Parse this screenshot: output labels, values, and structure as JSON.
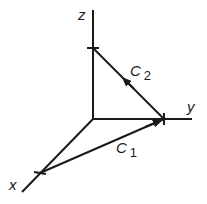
{
  "diagram": {
    "type": "3d-axes-path-diagram",
    "colors": {
      "line": "#1a1a1a",
      "background": "#ffffff"
    },
    "axes": [
      {
        "name": "z",
        "label": "z"
      },
      {
        "name": "y",
        "label": "y"
      },
      {
        "name": "x",
        "label": "x"
      }
    ],
    "paths": [
      {
        "name": "C1",
        "label_main": "C",
        "label_sub": "1",
        "from": "x-axis point",
        "to": "y-axis point"
      },
      {
        "name": "C2",
        "label_main": "C",
        "label_sub": "2",
        "from": "y-axis point",
        "to": "z-axis point"
      }
    ]
  }
}
